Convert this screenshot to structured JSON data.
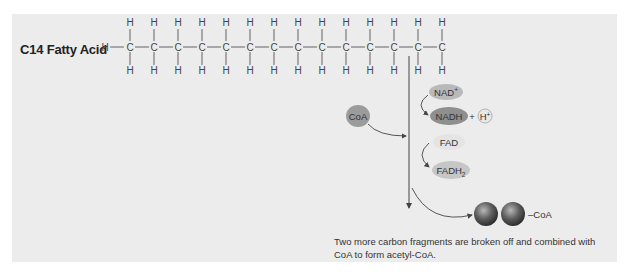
{
  "title": "C14 Fatty Acid",
  "molecule": {
    "carbon_count": 14,
    "atoms": {
      "carbon": "C",
      "hydrogen": "H"
    }
  },
  "reactants": {
    "coa": "CoA",
    "nad_plus": "NAD+",
    "nadh": "NADH",
    "plus": "+",
    "h_plus": "H+",
    "fad": "FAD",
    "fadh2": "FADH2"
  },
  "product": {
    "label": "–CoA"
  },
  "caption": "Two more carbon fragments are broken off and combined with CoA to form acetyl-CoA.",
  "colors": {
    "panel": "#ececec",
    "nad": "#b9b9b9",
    "nadh": "#8f8f8f",
    "fad": "#e4e4e4",
    "fadh2": "#c6c6c6",
    "coa": "#9b9b9b",
    "sphere": "#555555"
  }
}
